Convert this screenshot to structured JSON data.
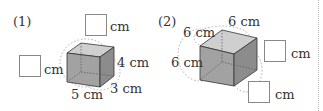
{
  "problems": [
    {
      "number": "(1)",
      "unit": "cm",
      "given": {
        "length": "5 cm",
        "width": "3 cm",
        "height": "4 cm"
      },
      "blanks": [
        {
          "unit": "cm"
        },
        {
          "unit": "cm"
        }
      ]
    },
    {
      "number": "(2)",
      "unit": "cm",
      "given": {
        "edge_a": "6 cm",
        "edge_b": "6 cm",
        "edge_c": "6 cm"
      },
      "blanks": [
        {
          "unit": "cm"
        },
        {
          "unit": "cm"
        }
      ]
    }
  ],
  "colors": {
    "front": "#9a9a9a",
    "top": "#c8c8c8",
    "side": "#8a8a8a",
    "stroke": "#333333"
  }
}
